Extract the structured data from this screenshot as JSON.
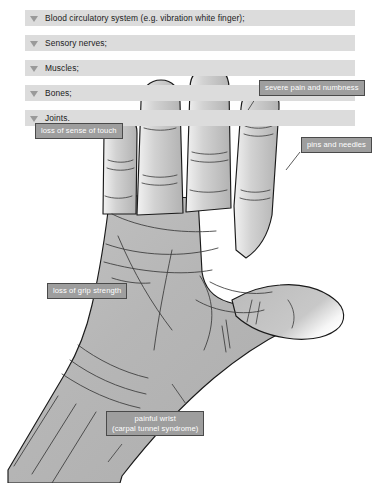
{
  "page": {
    "background_color": "#ffffff"
  },
  "affected_parts_list": {
    "bullet_icon": "triangle-down-icon",
    "row_background_color": "#dcdcdc",
    "text_color": "#1b1b1b",
    "items": [
      {
        "label": "Blood circulatory system (e.g. vibration white finger);"
      },
      {
        "label": "Sensory nerves;"
      },
      {
        "label": "Muscles;"
      },
      {
        "label": "Bones;"
      },
      {
        "label": "Joints."
      }
    ]
  },
  "callouts": {
    "fill_color": "#9e9e9e",
    "border_color": "#4a4a4a",
    "text_color": "#ffffff",
    "items": [
      {
        "id": "severe-pain",
        "line1": "severe pain and numbness",
        "line2": ""
      },
      {
        "id": "loss-of-touch",
        "line1": "loss of sense of touch",
        "line2": ""
      },
      {
        "id": "pins-and-needles",
        "line1": "pins and needles",
        "line2": ""
      },
      {
        "id": "loss-of-grip",
        "line1": "loss of grip strength",
        "line2": ""
      },
      {
        "id": "painful-wrist",
        "line1": "painful wrist",
        "line2": "(carpal tunnel syndrome)"
      }
    ]
  },
  "illustration": {
    "name": "open-left-hand-palm-diagram",
    "skin_fill_color": "#b6b6b6",
    "outline_color": "#1a1a1a",
    "highlight_color": "#ffffff",
    "description": "Open left hand, palm facing viewer, fingers pointing up, thumb extended to the right, wrist running to lower-left corner"
  }
}
